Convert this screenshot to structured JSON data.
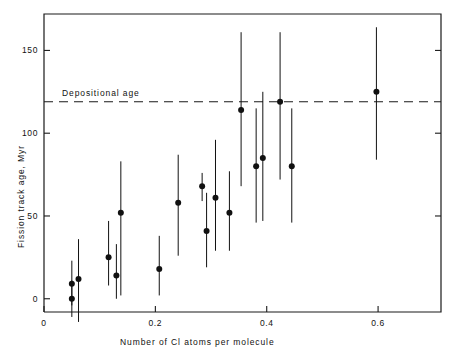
{
  "chart_data": {
    "type": "scatter",
    "title": "",
    "xlabel": "Number of Cl atoms per molecule",
    "ylabel": "Fission track age, Myr",
    "xlim": [
      0.0,
      0.713
    ],
    "ylim": [
      -8.0,
      172.0
    ],
    "xticks": [
      0,
      0.2,
      0.4,
      0.6
    ],
    "xtick_labels": [
      "0",
      "0.2",
      "0.4",
      "0.6"
    ],
    "yticks": [
      0,
      50,
      100,
      150
    ],
    "ytick_labels": [
      "0",
      "50",
      "100",
      "150"
    ],
    "grid": false,
    "legend": false,
    "error_bars": "vertical",
    "annotations": [
      {
        "name": "depositional-age-line",
        "label": "Depositional age",
        "type": "hline",
        "y": 119,
        "style": "dashed"
      }
    ],
    "series": [
      {
        "name": "Fission track ages",
        "marker": "filled-circle",
        "color": "#111111",
        "points": [
          {
            "x": 0.05,
            "y": 9,
            "ylow": -4,
            "yhigh": 23
          },
          {
            "x": 0.05,
            "y": 0,
            "ylow": -11,
            "yhigh": 11
          },
          {
            "x": 0.062,
            "y": 12,
            "ylow": -14,
            "yhigh": 36
          },
          {
            "x": 0.116,
            "y": 25,
            "ylow": 8,
            "yhigh": 47
          },
          {
            "x": 0.13,
            "y": 14,
            "ylow": 0,
            "yhigh": 33
          },
          {
            "x": 0.138,
            "y": 52,
            "ylow": 2,
            "yhigh": 83
          },
          {
            "x": 0.207,
            "y": 18,
            "ylow": 2,
            "yhigh": 38
          },
          {
            "x": 0.241,
            "y": 58,
            "ylow": 26,
            "yhigh": 87
          },
          {
            "x": 0.284,
            "y": 68,
            "ylow": 59,
            "yhigh": 76
          },
          {
            "x": 0.292,
            "y": 41,
            "ylow": 19,
            "yhigh": 64
          },
          {
            "x": 0.308,
            "y": 61,
            "ylow": 29,
            "yhigh": 96
          },
          {
            "x": 0.333,
            "y": 52,
            "ylow": 29,
            "yhigh": 77
          },
          {
            "x": 0.354,
            "y": 114,
            "ylow": 68,
            "yhigh": 161
          },
          {
            "x": 0.381,
            "y": 80,
            "ylow": 46,
            "yhigh": 115
          },
          {
            "x": 0.393,
            "y": 85,
            "ylow": 47,
            "yhigh": 125
          },
          {
            "x": 0.424,
            "y": 119,
            "ylow": 72,
            "yhigh": 161
          },
          {
            "x": 0.445,
            "y": 80,
            "ylow": 46,
            "yhigh": 115
          },
          {
            "x": 0.597,
            "y": 125,
            "ylow": 84,
            "yhigh": 164
          }
        ]
      }
    ]
  },
  "axes": {
    "ylabel_text": "Fission track age, Myr",
    "xlabel_text": "Number of Cl atoms per molecule",
    "depositional_label": "Depositional age"
  }
}
